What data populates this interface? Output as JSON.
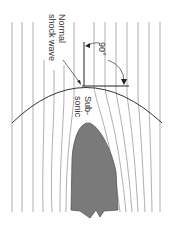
{
  "diagram": {
    "labels": {
      "shock_line1": "Normal",
      "shock_line2": "shock wave",
      "angle": "90°",
      "region_line1": "Sub-",
      "region_line2": "sonic"
    },
    "colors": {
      "background": "#ffffff",
      "streamline": "#9a9a9a",
      "shock": "#333333",
      "body_fill": "#7a7a7a",
      "body_stroke": "#555555",
      "text": "#333333"
    },
    "streamlines_upstream_x": [
      12,
      22,
      33,
      44,
      54,
      64,
      74,
      84,
      94,
      105,
      116,
      127,
      138,
      149,
      160
    ],
    "shock_wave": {
      "left": [
        12,
        123
      ],
      "peak": [
        85,
        86
      ],
      "right": [
        162,
        123
      ]
    },
    "body": {
      "tip": [
        88,
        123
      ],
      "base_left": 72,
      "base_right": 117,
      "base_y": 210
    }
  }
}
